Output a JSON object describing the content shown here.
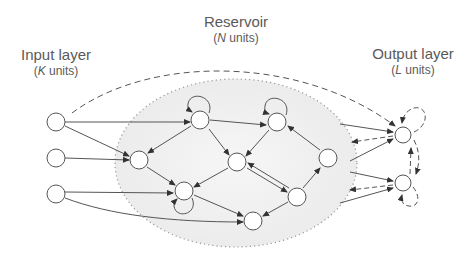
{
  "labels": {
    "input": {
      "title": "Input layer",
      "var": "K",
      "units": " units)"
    },
    "reservoir": {
      "title": "Reservoir",
      "var": "N",
      "units": " units)"
    },
    "output": {
      "title": "Output layer",
      "var": "L",
      "units": " units)"
    }
  },
  "colors": {
    "stroke": "#555555",
    "reservoir_fill": "#f0f0f0",
    "dots": "#a0a0a0"
  }
}
